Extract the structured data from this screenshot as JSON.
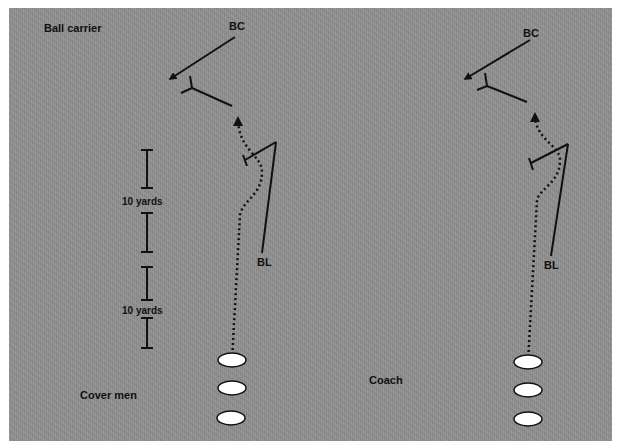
{
  "colors": {
    "field": "#8f8f8f",
    "line": "#111111",
    "marker_fill": "#ffffff"
  },
  "labels": {
    "ball_carrier": "Ball carrier",
    "cover_men": "Cover men",
    "coach": "Coach",
    "ten_yards_1": "10 yards",
    "ten_yards_2": "10 yards",
    "left": {
      "bc": "BC",
      "bl": "BL"
    },
    "right": {
      "bc": "BC",
      "bl": "BL"
    }
  },
  "markers": {
    "left_cover_men": [
      {
        "cx": 232,
        "cy": 360
      },
      {
        "cx": 232,
        "cy": 388
      },
      {
        "cx": 231,
        "cy": 418
      }
    ],
    "right_coach_group": [
      {
        "cx": 528,
        "cy": 362
      },
      {
        "cx": 528,
        "cy": 390
      },
      {
        "cx": 528,
        "cy": 419
      }
    ]
  },
  "scale": {
    "segment_yards": 10
  }
}
